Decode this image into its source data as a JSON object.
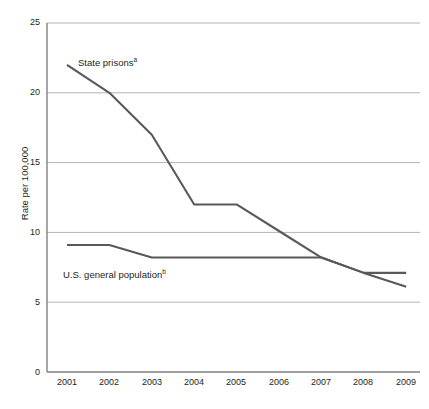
{
  "chart_data": {
    "type": "line",
    "title": "",
    "xlabel": "",
    "ylabel": "Rate per 100,000",
    "x": [
      2001,
      2002,
      2003,
      2004,
      2005,
      2006,
      2007,
      2008,
      2009
    ],
    "categories": [
      "2001",
      "2002",
      "2003",
      "2004",
      "2005",
      "2006",
      "2007",
      "2008",
      "2009"
    ],
    "xlim": [
      2001,
      2009
    ],
    "ylim": [
      0,
      25
    ],
    "y_ticks": [
      0,
      5,
      10,
      15,
      20,
      25
    ],
    "y_tick_labels": [
      "0",
      "5",
      "10",
      "15",
      "20",
      "25"
    ],
    "grid": "horizontal",
    "legend_position": "inline-annotations",
    "series": [
      {
        "name": "State prisons",
        "footnote": "a",
        "label_text": "State prisons",
        "color": "#595959",
        "values": [
          22.0,
          20.0,
          17.0,
          12.0,
          12.0,
          10.1,
          8.2,
          7.1,
          6.1
        ]
      },
      {
        "name": "U.S. general population",
        "footnote": "b",
        "label_text": "U.S. general population",
        "color": "#595959",
        "values": [
          9.1,
          9.1,
          8.2,
          8.2,
          8.2,
          8.2,
          8.2,
          7.1,
          7.1
        ]
      }
    ],
    "axis_color": "#808080",
    "grid_color": "#b3b3b3"
  }
}
